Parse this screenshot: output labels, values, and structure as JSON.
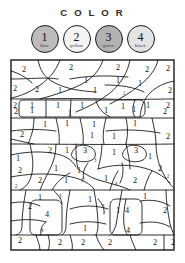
{
  "page": {
    "title": "C O L O R",
    "type": "color-by-number-worksheet"
  },
  "legend": {
    "items": [
      {
        "number": "1",
        "color_name": "blue",
        "swatch": "#b8b8b8"
      },
      {
        "number": "2",
        "color_name": "yellow",
        "swatch": "#f2f2f2"
      },
      {
        "number": "3",
        "color_name": "green",
        "swatch": "#b0b0b0"
      },
      {
        "number": "4",
        "color_name": "black",
        "swatch": "#e2e2e2"
      }
    ]
  },
  "puzzle": {
    "frame_color": "#1a1a1a",
    "line_color": "#1a1a1a",
    "background": "#ffffff",
    "region_numbers": [
      {
        "id": "r1",
        "value": "2",
        "x": 14,
        "y": 11,
        "size": "large"
      },
      {
        "id": "r2",
        "value": "2",
        "x": 61,
        "y": 9,
        "size": "large"
      },
      {
        "id": "r3",
        "value": "2",
        "x": 108,
        "y": 9,
        "size": "large"
      },
      {
        "id": "r4",
        "value": "2",
        "x": 137,
        "y": 11,
        "size": "large"
      },
      {
        "id": "r5",
        "value": "2",
        "x": 158,
        "y": 10,
        "size": "large"
      },
      {
        "id": "r6",
        "value": "1",
        "x": 76,
        "y": 22,
        "size": "large"
      },
      {
        "id": "r7",
        "value": "1",
        "x": 108,
        "y": 22,
        "size": "large"
      },
      {
        "id": "r8",
        "value": "1",
        "x": 130,
        "y": 25,
        "size": "large"
      },
      {
        "id": "r9",
        "value": "2",
        "x": 5,
        "y": 30,
        "size": "large"
      },
      {
        "id": "r10",
        "value": "2",
        "x": 27,
        "y": 31,
        "size": "large"
      },
      {
        "id": "r11",
        "value": "1",
        "x": 50,
        "y": 32,
        "size": "large"
      },
      {
        "id": "r12",
        "value": "1",
        "x": 85,
        "y": 32,
        "size": "large"
      },
      {
        "id": "r13",
        "value": "1",
        "x": 114,
        "y": 35,
        "size": "small"
      },
      {
        "id": "r14",
        "value": "2",
        "x": 160,
        "y": 32,
        "size": "large"
      },
      {
        "id": "r15",
        "value": "2",
        "x": 5,
        "y": 47,
        "size": "large"
      },
      {
        "id": "r16",
        "value": "1",
        "x": 22,
        "y": 47,
        "size": "large"
      },
      {
        "id": "r17",
        "value": "1",
        "x": 48,
        "y": 47,
        "size": "large"
      },
      {
        "id": "r18",
        "value": "1",
        "x": 72,
        "y": 47,
        "size": "large"
      },
      {
        "id": "r19",
        "value": "1",
        "x": 113,
        "y": 48,
        "size": "large"
      },
      {
        "id": "r20",
        "value": "1",
        "x": 138,
        "y": 47,
        "size": "large"
      },
      {
        "id": "r21",
        "value": "2",
        "x": 158,
        "y": 47,
        "size": "large"
      },
      {
        "id": "r22",
        "value": "2",
        "x": 6,
        "y": 53,
        "size": "large"
      },
      {
        "id": "r23",
        "value": "1",
        "x": 22,
        "y": 52,
        "size": "large"
      },
      {
        "id": "r24",
        "value": "1",
        "x": 60,
        "y": 55,
        "size": "large"
      },
      {
        "id": "r25",
        "value": "1",
        "x": 96,
        "y": 52,
        "size": "large"
      },
      {
        "id": "r26",
        "value": "1",
        "x": 124,
        "y": 51,
        "size": "large"
      },
      {
        "id": "r27",
        "value": "2",
        "x": 155,
        "y": 53,
        "size": "large"
      },
      {
        "id": "r28",
        "value": "1",
        "x": 35,
        "y": 66,
        "size": "large"
      },
      {
        "id": "r29",
        "value": "1",
        "x": 57,
        "y": 65,
        "size": "large"
      },
      {
        "id": "r30",
        "value": "1",
        "x": 84,
        "y": 66,
        "size": "large"
      },
      {
        "id": "r31",
        "value": "1",
        "x": 125,
        "y": 65,
        "size": "large"
      },
      {
        "id": "r32",
        "value": "2",
        "x": 12,
        "y": 76,
        "size": "large"
      },
      {
        "id": "r33",
        "value": "1",
        "x": 82,
        "y": 77,
        "size": "large"
      },
      {
        "id": "r34",
        "value": "1",
        "x": 104,
        "y": 78,
        "size": "large"
      },
      {
        "id": "r35",
        "value": "2",
        "x": 158,
        "y": 78,
        "size": "large"
      },
      {
        "id": "r36",
        "value": "2",
        "x": 40,
        "y": 92,
        "size": "large"
      },
      {
        "id": "r37",
        "value": "1",
        "x": 57,
        "y": 92,
        "size": "large"
      },
      {
        "id": "r38",
        "value": "3",
        "x": 75,
        "y": 92,
        "size": "large"
      },
      {
        "id": "r39",
        "value": "1",
        "x": 104,
        "y": 94,
        "size": "large"
      },
      {
        "id": "r40",
        "value": "3",
        "x": 126,
        "y": 92,
        "size": "large"
      },
      {
        "id": "r41",
        "value": "1",
        "x": 8,
        "y": 100,
        "size": "large"
      },
      {
        "id": "r42",
        "value": "1",
        "x": 140,
        "y": 98,
        "size": "large"
      },
      {
        "id": "r43",
        "value": "3",
        "x": 85,
        "y": 102,
        "size": "small"
      },
      {
        "id": "r44",
        "value": "2",
        "x": 10,
        "y": 112,
        "size": "large"
      },
      {
        "id": "r45",
        "value": "1",
        "x": 46,
        "y": 110,
        "size": "large"
      },
      {
        "id": "r46",
        "value": "1",
        "x": 69,
        "y": 112,
        "size": "large"
      },
      {
        "id": "r47",
        "value": "2",
        "x": 150,
        "y": 110,
        "size": "large"
      },
      {
        "id": "r48",
        "value": "2",
        "x": 30,
        "y": 122,
        "size": "large"
      },
      {
        "id": "r49",
        "value": "1",
        "x": 56,
        "y": 122,
        "size": "large"
      },
      {
        "id": "r50",
        "value": "1",
        "x": 96,
        "y": 120,
        "size": "large"
      },
      {
        "id": "r51",
        "value": "2",
        "x": 125,
        "y": 122,
        "size": "large"
      },
      {
        "id": "r52",
        "value": "2",
        "x": 158,
        "y": 118,
        "size": "small"
      },
      {
        "id": "r53",
        "value": "2",
        "x": 6,
        "y": 128,
        "size": "large"
      },
      {
        "id": "r54",
        "value": "3",
        "x": 72,
        "y": 122,
        "size": "small"
      },
      {
        "id": "r55",
        "value": "3",
        "x": 106,
        "y": 126,
        "size": "small"
      },
      {
        "id": "r56",
        "value": "1",
        "x": 30,
        "y": 139,
        "size": "large"
      },
      {
        "id": "r57",
        "value": "3",
        "x": 50,
        "y": 138,
        "size": "small"
      },
      {
        "id": "r58",
        "value": "1",
        "x": 80,
        "y": 141,
        "size": "large"
      },
      {
        "id": "r59",
        "value": "1",
        "x": 135,
        "y": 138,
        "size": "large"
      },
      {
        "id": "r60",
        "value": "2",
        "x": 20,
        "y": 148,
        "size": "large"
      },
      {
        "id": "r61",
        "value": "3",
        "x": 93,
        "y": 148,
        "size": "small"
      },
      {
        "id": "r62",
        "value": "4",
        "x": 37,
        "y": 156,
        "size": "large"
      },
      {
        "id": "r63",
        "value": "1",
        "x": 108,
        "y": 152,
        "size": "large"
      },
      {
        "id": "r64",
        "value": "4",
        "x": 117,
        "y": 152,
        "size": "large"
      },
      {
        "id": "r65",
        "value": "2",
        "x": 155,
        "y": 152,
        "size": "large"
      },
      {
        "id": "r66",
        "value": "4",
        "x": 32,
        "y": 172,
        "size": "small"
      },
      {
        "id": "r67",
        "value": "1",
        "x": 75,
        "y": 170,
        "size": "large"
      },
      {
        "id": "r68",
        "value": "4",
        "x": 118,
        "y": 172,
        "size": "large"
      },
      {
        "id": "r69",
        "value": "2",
        "x": 10,
        "y": 182,
        "size": "large"
      },
      {
        "id": "r70",
        "value": "2",
        "x": 50,
        "y": 184,
        "size": "large"
      },
      {
        "id": "r71",
        "value": "2",
        "x": 73,
        "y": 184,
        "size": "large"
      },
      {
        "id": "r72",
        "value": "2",
        "x": 100,
        "y": 184,
        "size": "large"
      },
      {
        "id": "r73",
        "value": "2",
        "x": 145,
        "y": 184,
        "size": "large"
      },
      {
        "id": "r74",
        "value": "2",
        "x": 163,
        "y": 184,
        "size": "large"
      }
    ]
  }
}
